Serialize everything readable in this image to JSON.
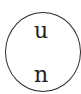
{
  "diagram": {
    "node": {
      "shape": "circle",
      "stroke_color": "#2a2a2a",
      "top_label": "u",
      "bottom_label": "n"
    }
  }
}
